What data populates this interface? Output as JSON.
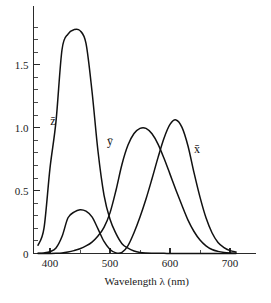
{
  "chart_data": {
    "type": "line",
    "title": "",
    "xlabel": "Wavelength λ (nm)",
    "ylabel": "",
    "xlim": [
      375,
      712
    ],
    "ylim": [
      0,
      1.92
    ],
    "grid": false,
    "legend_position": "inline-annotations",
    "x_ticks_major": [
      400,
      500,
      600,
      700
    ],
    "x_tick_labels": [
      "400",
      "500",
      "600",
      "700"
    ],
    "x_ticks_minor": [
      450,
      550,
      650
    ],
    "y_ticks_major": [
      0,
      0.5,
      1.0,
      1.5
    ],
    "y_tick_labels": [
      "0",
      "0.5",
      "1.0",
      "1.5"
    ],
    "y_ticks_minor": [
      0.1,
      0.2,
      0.3,
      0.4,
      0.6,
      0.7,
      0.8,
      0.9,
      1.1,
      1.2,
      1.3,
      1.4,
      1.6,
      1.7,
      1.8
    ],
    "annotations": [
      {
        "text": "z̄",
        "x": 405,
        "y": 1.02,
        "name": "z-bar"
      },
      {
        "text": "ȳ",
        "x": 500,
        "y": 0.86,
        "name": "y-bar"
      },
      {
        "text": "x̄",
        "x": 645,
        "y": 0.8,
        "name": "x-bar"
      }
    ],
    "x": [
      380,
      390,
      400,
      410,
      420,
      430,
      440,
      450,
      460,
      470,
      480,
      490,
      500,
      510,
      520,
      530,
      540,
      550,
      560,
      570,
      580,
      590,
      600,
      610,
      620,
      630,
      640,
      650,
      660,
      670,
      680,
      690,
      700,
      710
    ],
    "series": [
      {
        "name": "x̄",
        "label": "x-bar",
        "color": "#111111",
        "peak_value": 1.06,
        "peak_x": 600,
        "secondary_peak_value": 0.33,
        "secondary_peak_x": 445,
        "values": [
          0.0014,
          0.0042,
          0.0143,
          0.0435,
          0.1344,
          0.2839,
          0.3285,
          0.3483,
          0.3362,
          0.2908,
          0.1954,
          0.0956,
          0.032,
          0.0049,
          0.0093,
          0.0633,
          0.1655,
          0.2904,
          0.4334,
          0.5945,
          0.7621,
          0.9163,
          1.0263,
          1.0622,
          1.0026,
          0.8544,
          0.6424,
          0.4479,
          0.2835,
          0.1649,
          0.0874,
          0.0468,
          0.0227,
          0.0114
        ]
      },
      {
        "name": "ȳ",
        "label": "y-bar",
        "color": "#111111",
        "peak_value": 1.0,
        "peak_x": 555,
        "values": [
          0.0,
          0.0001,
          0.0004,
          0.0012,
          0.004,
          0.0116,
          0.023,
          0.038,
          0.06,
          0.091,
          0.139,
          0.208,
          0.323,
          0.503,
          0.71,
          0.862,
          0.954,
          0.995,
          0.995,
          0.952,
          0.87,
          0.757,
          0.631,
          0.503,
          0.381,
          0.265,
          0.175,
          0.107,
          0.061,
          0.032,
          0.017,
          0.0082,
          0.0041,
          0.0021
        ]
      },
      {
        "name": "z̄",
        "label": "z-bar",
        "color": "#111111",
        "peak_value": 1.78,
        "peak_x": 445,
        "values": [
          0.065,
          0.201,
          0.679,
          1.05,
          1.62,
          1.745,
          1.78,
          1.772,
          1.67,
          1.29,
          0.813,
          0.465,
          0.272,
          0.158,
          0.0782,
          0.0422,
          0.0203,
          0.0087,
          0.0039,
          0.0021,
          0.0017,
          0.0011,
          0.0008,
          0.0003,
          0.0002,
          0.0,
          0.0,
          0.0,
          0.0,
          0.0,
          0.0,
          0.0,
          0.0,
          0.0
        ]
      }
    ]
  }
}
